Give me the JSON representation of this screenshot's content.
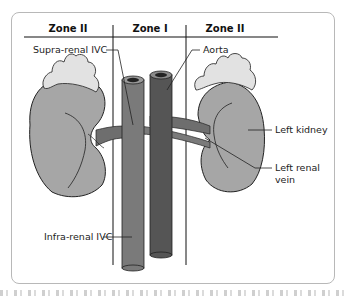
{
  "diagram": {
    "zones": [
      {
        "label": "Zone II",
        "position": "left"
      },
      {
        "label": "Zone I",
        "position": "center"
      },
      {
        "label": "Zone II",
        "position": "right"
      }
    ],
    "labels": {
      "supra_renal_ivc": "Supra-renal IVC",
      "aorta": "Aorta",
      "left_kidney": "Left kidney",
      "left_renal_vein_line1": "Left renal",
      "left_renal_vein_line2": "vein",
      "infra_renal_ivc": "Infra-renal IVC"
    },
    "colors": {
      "kidney": "#a6a6a6",
      "adrenal": "#e2e2e2",
      "ivc": "#7a7a7a",
      "aorta": "#555555",
      "lines": "#111111",
      "frame_border": "#b8b8b8"
    }
  }
}
